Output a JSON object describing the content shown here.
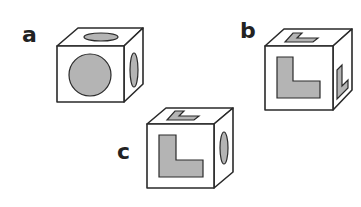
{
  "diagram": {
    "type": "cube-puzzle",
    "colors": {
      "shape_fill": "#b4b4b4",
      "outline": "#2a2a2a",
      "face": "#ffffff"
    },
    "cubes": [
      {
        "label": "a",
        "front": "circle",
        "top": "circle",
        "right": "circle"
      },
      {
        "label": "b",
        "front": "L-shape",
        "top": "L-shape",
        "right": "L-shape"
      },
      {
        "label": "c",
        "front": "L-shape",
        "top": "L-shape",
        "right": "circle"
      }
    ]
  }
}
